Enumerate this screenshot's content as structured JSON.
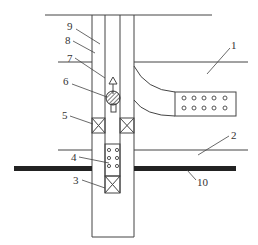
{
  "figure": {
    "type": "wellbore-schematic",
    "colors": {
      "line": "#444444",
      "bar": "#222222",
      "background": "#ffffff"
    },
    "labels": [
      {
        "id": "1",
        "text": "1"
      },
      {
        "id": "2",
        "text": "2"
      },
      {
        "id": "3",
        "text": "3"
      },
      {
        "id": "4",
        "text": "4"
      },
      {
        "id": "5",
        "text": "5"
      },
      {
        "id": "6",
        "text": "6"
      },
      {
        "id": "7",
        "text": "7"
      },
      {
        "id": "8",
        "text": "8"
      },
      {
        "id": "9",
        "text": "9"
      },
      {
        "id": "10",
        "text": "10"
      }
    ]
  }
}
